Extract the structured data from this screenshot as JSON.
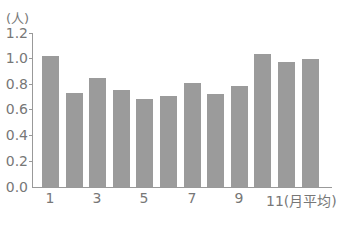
{
  "chart_data": {
    "type": "bar",
    "title": "",
    "ylabel": "(人)",
    "xlabel": "",
    "ylim": [
      0,
      1.2
    ],
    "yticks": [
      "0.0",
      "0.2",
      "0.4",
      "0.6",
      "0.8",
      "1.0",
      "1.2"
    ],
    "categories": [
      "1",
      "2",
      "3",
      "4",
      "5",
      "6",
      "7",
      "8",
      "9",
      "10",
      "11",
      "(月平均)"
    ],
    "xtick_labels": [
      "1",
      "3",
      "5",
      "7",
      "9",
      "11(月平均)"
    ],
    "values": [
      1.02,
      0.73,
      0.85,
      0.755,
      0.685,
      0.71,
      0.81,
      0.72,
      0.785,
      1.035,
      0.97,
      1.0
    ],
    "grid": false,
    "bar_color": "#9b9b9b"
  },
  "labels": {
    "unit": "(人)",
    "y": [
      "1.2",
      "1.0",
      "0.8",
      "0.6",
      "0.4",
      "0.2",
      "0.0"
    ],
    "x": [
      "1",
      "3",
      "5",
      "7",
      "9",
      "11(月平均)"
    ]
  }
}
